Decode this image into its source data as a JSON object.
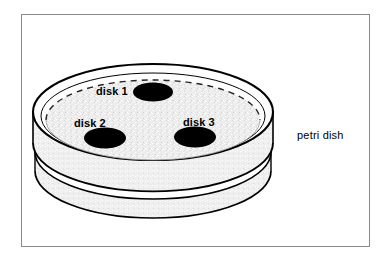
{
  "figure": {
    "background_color": "#ffffff",
    "frame_border_color": "#8a8a8a"
  },
  "dish": {
    "name": "petri-dish",
    "label": "petri dish",
    "lid_fill": "#ffffff",
    "agar_fill": "#e8e8e8",
    "outline_color": "#000000",
    "dashed_arc_description": "hidden rear edge of lid shown dashed"
  },
  "disks": [
    {
      "id": "disk-1",
      "label": "disk 1",
      "fill": "#000000",
      "cx": 153,
      "cy": 92,
      "rx": 20,
      "ry": 9.5,
      "label_x": 96,
      "label_y": 93
    },
    {
      "id": "disk-2",
      "label": "disk 2",
      "fill": "#000000",
      "cx": 105,
      "cy": 138,
      "rx": 21,
      "ry": 10.5,
      "label_x": 74,
      "label_y": 126
    },
    {
      "id": "disk-3",
      "label": "disk 3",
      "fill": "#000000",
      "cx": 195,
      "cy": 137,
      "rx": 21,
      "ry": 10.5,
      "label_x": 183,
      "label_y": 125
    }
  ],
  "callout": {
    "petri_dish_label": "petri dish",
    "petri_dish_label_x": 297,
    "petri_dish_label_y": 139
  }
}
